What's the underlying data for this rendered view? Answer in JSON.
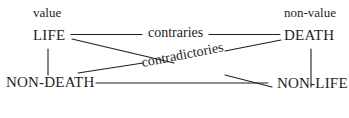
{
  "diagram": {
    "type": "semiotic-square",
    "ink_color": "#1e1e1e",
    "background": "#ffffff",
    "labels": {
      "top_left_heading": "value",
      "top_right_heading": "non-value",
      "top_left_term": "LIFE",
      "top_right_term": "DEATH",
      "bottom_left_term": "NON-DEATH",
      "bottom_right_term": "NON-LIFE",
      "top_relation": "contraries",
      "diagonal_relation": "contradictories"
    },
    "edges": [
      {
        "from": "LIFE",
        "to": "DEATH",
        "label": "contraries"
      },
      {
        "from": "LIFE",
        "to": "NON-LIFE",
        "label": "contradictories"
      },
      {
        "from": "DEATH",
        "to": "NON-DEATH",
        "label": "contradictories"
      },
      {
        "from": "LIFE",
        "to": "NON-DEATH"
      },
      {
        "from": "DEATH",
        "to": "NON-LIFE"
      },
      {
        "from": "NON-DEATH",
        "to": "NON-LIFE"
      }
    ]
  }
}
